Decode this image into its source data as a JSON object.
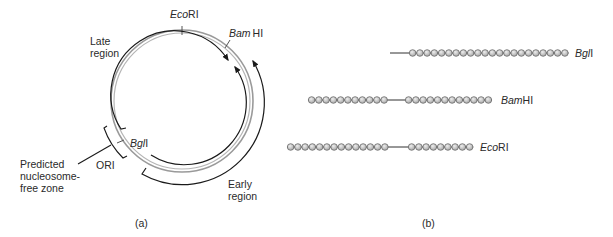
{
  "panel_a": {
    "caption": "(a)",
    "sites": {
      "ecori": {
        "italic": "Eco",
        "roman": "RI"
      },
      "bamhi": {
        "italic": "Bam",
        "roman": "HI"
      },
      "bgli": {
        "italic": "Bgl",
        "roman": "I"
      }
    },
    "late_region": [
      "Late",
      "region"
    ],
    "early_region": [
      "Early",
      "region"
    ],
    "ori": "ORI",
    "nucleosome_free": [
      "Predicted",
      "nucleosome-",
      "free zone"
    ]
  },
  "panel_b": {
    "caption": "(b)",
    "rows": [
      {
        "label_italic": "Bgl",
        "label_roman": "I",
        "line_start": 390,
        "groups": [
          {
            "start": 409,
            "count": 22
          }
        ]
      },
      {
        "label_italic": "Bam",
        "label_roman": "HI",
        "groups": [
          {
            "start": 308,
            "count": 11
          },
          {
            "start": 405,
            "count": 12
          }
        ]
      },
      {
        "label_italic": "Eco",
        "label_roman": "RI",
        "groups": [
          {
            "start": 287,
            "count": 14
          },
          {
            "start": 408,
            "count": 9
          }
        ]
      }
    ]
  },
  "colors": {
    "ring": "#8a8a8a",
    "line": "#1a1a1a",
    "bead_fill": "#c8c8c8",
    "bead_stroke": "#6a6a6a"
  }
}
